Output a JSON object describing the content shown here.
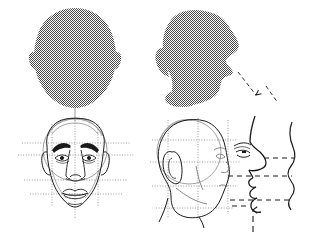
{
  "figure": {
    "background_color": "#ffffff",
    "ink_color": "#1a1a1a",
    "silhouette_fill": "#808080",
    "construction_line_color": "#8a8a8a",
    "guide_line_color": "#707070"
  },
  "panels": [
    {
      "id": "front-silhouette",
      "name": "front-head-silhouette",
      "position": "top-left",
      "view": "front",
      "rendering": "solid shaded mass",
      "features": [
        "egg-shaped cranium",
        "left ear bump",
        "right ear bump",
        "tapered jaw",
        "rounded chin"
      ],
      "fill": "#808080",
      "label": ""
    },
    {
      "id": "profile-silhouette",
      "name": "profile-head-silhouette",
      "position": "top-right",
      "view": "profile facing right",
      "rendering": "solid shaded mass",
      "features": [
        "brow ridge",
        "nose",
        "lips",
        "chin",
        "jaw line",
        "neck",
        "back of skull"
      ],
      "fill": "#808080",
      "label": ""
    },
    {
      "id": "front-construction",
      "name": "front-face-construction",
      "position": "bottom-left",
      "view": "front",
      "rendering": "line drawing with proportion guides",
      "features": [
        "center vertical axis",
        "brow line",
        "eye line",
        "nose base line",
        "mouth line",
        "eyebrows",
        "eyes",
        "nose",
        "lips",
        "ears",
        "jaw"
      ],
      "label": ""
    },
    {
      "id": "profile-construction",
      "name": "profile-head-construction",
      "position": "bottom-right",
      "view": "profile facing right",
      "rendering": "line drawing with square proportion grid",
      "features": [
        "cranium circle",
        "grid squares",
        "ear",
        "eye",
        "nose",
        "mouth",
        "chin",
        "jaw",
        "neck"
      ],
      "label": ""
    },
    {
      "id": "profile-detail",
      "name": "profile-contour-detail",
      "position": "far-right",
      "view": "profile contour enlargement",
      "rendering": "outline plus simplified wave contour",
      "features": [
        "brow",
        "nose",
        "lips",
        "chin"
      ],
      "label": ""
    }
  ],
  "annotations": {
    "alignment_lines": [
      {
        "name": "brow-alignment",
        "style": "dashed",
        "orientation": "horizontal"
      },
      {
        "name": "nose-base-alignment",
        "style": "dashed",
        "orientation": "horizontal"
      },
      {
        "name": "mouth-alignment",
        "style": "dashed",
        "orientation": "horizontal"
      }
    ],
    "leader_lines": [
      {
        "name": "silhouette-to-detail-leader",
        "style": "dashed diagonal with arrowhead",
        "from": "profile-head-silhouette",
        "to": "profile-contour-detail"
      }
    ],
    "pointers": [
      {
        "name": "chin-arrow",
        "style": "dashed vertical with up arrowhead",
        "points_to": "chin"
      }
    ],
    "drop_line": {
      "name": "silhouette-to-construction-drop",
      "style": "thin vertical",
      "from": "front-head-silhouette",
      "to": "front-face-construction"
    }
  },
  "text": {
    "caption": "",
    "figure_number": "",
    "notes": ""
  }
}
